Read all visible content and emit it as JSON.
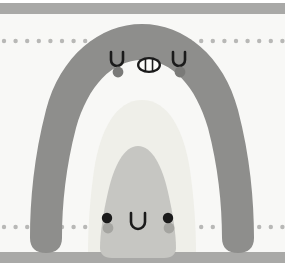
{
  "canvas": {
    "width": 285,
    "height": 270,
    "background_color": "#f8f8f6",
    "outer_color": "#ffffff"
  },
  "palette": {
    "background": "#f8f8f6",
    "band_gray": "#a9a9a7",
    "dot_gray": "#b8b8b6",
    "big_character": "#8e8e8c",
    "inner_arch": "#efefe9",
    "small_character": "#c6c6c2",
    "ink": "#1b1b1b",
    "blush_big": "#7a7a78",
    "blush_small": "#a5a5a1",
    "tooth_white": "#fbfbf9"
  },
  "bands": {
    "top_bar": {
      "label": "top-gray-band",
      "y": 3,
      "height": 11
    },
    "bottom_bar": {
      "label": "bottom-gray-band",
      "y": 252,
      "height": 11
    }
  },
  "dot_rows": [
    {
      "label": "upper-dot-row",
      "y": 41,
      "count": 25,
      "spacing": 11.6,
      "radius": 2.2
    },
    {
      "label": "lower-dot-row",
      "y": 227,
      "count": 25,
      "spacing": 11.6,
      "radius": 2.2
    }
  ],
  "big_character": {
    "name": "large-gray-arch-creature",
    "fill": "#8e8e8c",
    "eyes": [
      {
        "side": "left",
        "cx": 117,
        "cy": 59,
        "type": "u-curve"
      },
      {
        "side": "right",
        "cx": 179,
        "cy": 59,
        "type": "u-curve"
      }
    ],
    "blush": [
      {
        "side": "left",
        "cx": 118,
        "cy": 72,
        "r": 5.4
      },
      {
        "side": "right",
        "cx": 180,
        "cy": 72,
        "r": 5.4
      }
    ],
    "mouth": {
      "type": "oval-open-teeth",
      "cx": 149,
      "cy": 65,
      "rx": 12,
      "ry": 8,
      "teeth": 3
    }
  },
  "inner_arch": {
    "name": "inner-light-arch",
    "fill": "#efefe9"
  },
  "small_character": {
    "name": "small-gray-blob-creature",
    "fill": "#c6c6c2",
    "eyes": [
      {
        "side": "left",
        "cx": 107,
        "cy": 218,
        "r": 5.2
      },
      {
        "side": "right",
        "cx": 168,
        "cy": 218,
        "r": 5.2
      }
    ],
    "blush": [
      {
        "side": "left",
        "cx": 108,
        "cy": 228,
        "r": 5.4
      },
      {
        "side": "right",
        "cx": 169,
        "cy": 228,
        "r": 5.4
      }
    ],
    "mouth": {
      "type": "u-curve",
      "cx": 138,
      "cy": 220
    }
  }
}
